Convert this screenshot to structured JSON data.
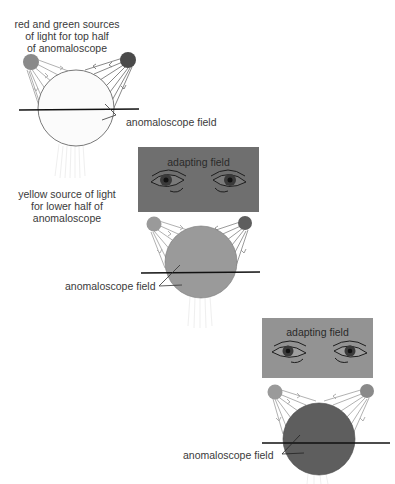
{
  "figure": {
    "panels": [
      {
        "id": "panel-1",
        "caption_lines": [
          "red and green sources",
          "of light for top half",
          "of anomaloscope"
        ],
        "field_label": "anomaloscope field",
        "field_color": "#fbfbfb",
        "sources": {
          "left_color": "#8a8a8a",
          "right_color": "#4a4a4a"
        }
      },
      {
        "id": "panel-2",
        "adapting_field_label": "adapting field",
        "adapting_field_color": "#6f6f6f",
        "caption_lines": [
          "yellow source of light",
          "for lower half of",
          "anomaloscope"
        ],
        "field_label": "anomaloscope field",
        "field_color": "#9a9a9a",
        "sources": {
          "left_color": "#9a9a9a",
          "right_color": "#5e5e5e"
        }
      },
      {
        "id": "panel-3",
        "adapting_field_label": "adapting field",
        "adapting_field_color": "#939393",
        "field_label": "anomaloscope field",
        "field_color": "#5e5e5e",
        "sources": {
          "left_color": "#9a9a9a",
          "right_color": "#8a8a8a"
        }
      }
    ]
  }
}
